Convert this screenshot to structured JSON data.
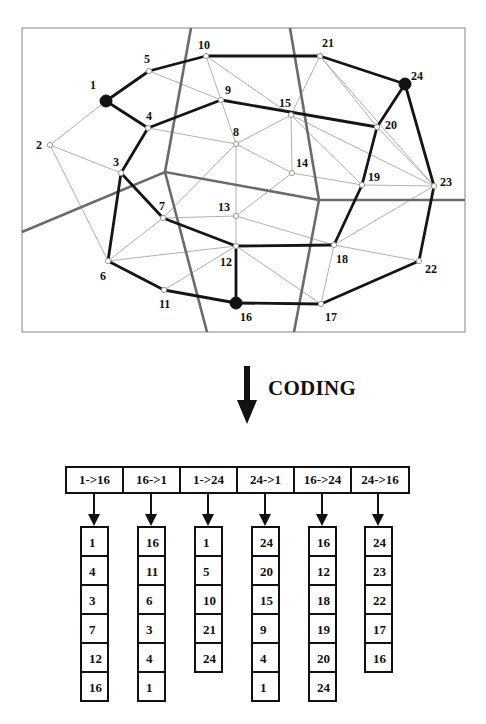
{
  "graph": {
    "nodes": [
      {
        "id": "1",
        "x": 106,
        "y": 101,
        "filled": true,
        "lx": -16,
        "ly": -12
      },
      {
        "id": "2",
        "x": 50,
        "y": 145,
        "filled": false,
        "lx": -14,
        "ly": 4
      },
      {
        "id": "3",
        "x": 121,
        "y": 173,
        "filled": false,
        "lx": -8,
        "ly": -7
      },
      {
        "id": "4",
        "x": 148,
        "y": 128,
        "filled": false,
        "lx": -2,
        "ly": -8
      },
      {
        "id": "5",
        "x": 149,
        "y": 71,
        "filled": false,
        "lx": -5,
        "ly": -8
      },
      {
        "id": "6",
        "x": 108,
        "y": 261,
        "filled": false,
        "lx": -8,
        "ly": 19
      },
      {
        "id": "7",
        "x": 163,
        "y": 218,
        "filled": false,
        "lx": -4,
        "ly": -8
      },
      {
        "id": "8",
        "x": 236,
        "y": 144,
        "filled": false,
        "lx": -3,
        "ly": -8
      },
      {
        "id": "9",
        "x": 221,
        "y": 100,
        "filled": false,
        "lx": 4,
        "ly": -6
      },
      {
        "id": "10",
        "x": 206,
        "y": 56,
        "filled": false,
        "lx": -8,
        "ly": -7
      },
      {
        "id": "11",
        "x": 164,
        "y": 290,
        "filled": false,
        "lx": -5,
        "ly": 18
      },
      {
        "id": "12",
        "x": 236,
        "y": 246,
        "filled": false,
        "lx": -16,
        "ly": 20
      },
      {
        "id": "13",
        "x": 236,
        "y": 216,
        "filled": false,
        "lx": -18,
        "ly": -5
      },
      {
        "id": "14",
        "x": 292,
        "y": 173,
        "filled": false,
        "lx": 4,
        "ly": -6
      },
      {
        "id": "15",
        "x": 291,
        "y": 115,
        "filled": false,
        "lx": -12,
        "ly": -8
      },
      {
        "id": "16",
        "x": 236,
        "y": 303,
        "filled": true,
        "lx": 4,
        "ly": 18
      },
      {
        "id": "17",
        "x": 321,
        "y": 304,
        "filled": false,
        "lx": 4,
        "ly": 17
      },
      {
        "id": "18",
        "x": 334,
        "y": 245,
        "filled": false,
        "lx": 2,
        "ly": 18
      },
      {
        "id": "19",
        "x": 362,
        "y": 185,
        "filled": false,
        "lx": 6,
        "ly": -4
      },
      {
        "id": "20",
        "x": 377,
        "y": 127,
        "filled": false,
        "lx": 8,
        "ly": 2
      },
      {
        "id": "21",
        "x": 320,
        "y": 56,
        "filled": false,
        "lx": 2,
        "ly": -9
      },
      {
        "id": "22",
        "x": 419,
        "y": 261,
        "filled": false,
        "lx": 6,
        "ly": 12
      },
      {
        "id": "23",
        "x": 434,
        "y": 186,
        "filled": false,
        "lx": 6,
        "ly": 0
      },
      {
        "id": "24",
        "x": 405,
        "y": 84,
        "filled": true,
        "lx": 6,
        "ly": -4
      }
    ],
    "thin_edges": [
      [
        "1",
        "2"
      ],
      [
        "2",
        "3"
      ],
      [
        "2",
        "6"
      ],
      [
        "3",
        "6"
      ],
      [
        "3",
        "7"
      ],
      [
        "4",
        "8"
      ],
      [
        "5",
        "9"
      ],
      [
        "10",
        "9"
      ],
      [
        "10",
        "15"
      ],
      [
        "9",
        "8"
      ],
      [
        "8",
        "15"
      ],
      [
        "8",
        "13"
      ],
      [
        "8",
        "14"
      ],
      [
        "8",
        "7"
      ],
      [
        "15",
        "14"
      ],
      [
        "15",
        "21"
      ],
      [
        "15",
        "19"
      ],
      [
        "15",
        "23"
      ],
      [
        "21",
        "20"
      ],
      [
        "21",
        "23"
      ],
      [
        "14",
        "13"
      ],
      [
        "14",
        "19"
      ],
      [
        "19",
        "23"
      ],
      [
        "19",
        "20"
      ],
      [
        "13",
        "7"
      ],
      [
        "13",
        "12"
      ],
      [
        "13",
        "18"
      ],
      [
        "7",
        "6"
      ],
      [
        "6",
        "12"
      ],
      [
        "11",
        "12"
      ],
      [
        "12",
        "17"
      ],
      [
        "18",
        "17"
      ],
      [
        "18",
        "23"
      ],
      [
        "18",
        "22"
      ],
      [
        "20",
        "23"
      ]
    ],
    "thick_edges": [
      [
        "1",
        "5"
      ],
      [
        "5",
        "10"
      ],
      [
        "10",
        "21"
      ],
      [
        "21",
        "24"
      ],
      [
        "1",
        "4"
      ],
      [
        "4",
        "9"
      ],
      [
        "9",
        "20"
      ],
      [
        "20",
        "24"
      ],
      [
        "4",
        "3"
      ],
      [
        "3",
        "7"
      ],
      [
        "7",
        "12"
      ],
      [
        "12",
        "16"
      ],
      [
        "3",
        "6"
      ],
      [
        "6",
        "11"
      ],
      [
        "11",
        "16"
      ],
      [
        "16",
        "17"
      ],
      [
        "17",
        "22"
      ],
      [
        "22",
        "23"
      ],
      [
        "23",
        "24"
      ],
      [
        "12",
        "18"
      ],
      [
        "18",
        "19"
      ],
      [
        "19",
        "20"
      ]
    ],
    "boundaries": [
      [
        [
          191,
          28
        ],
        [
          165,
          172
        ],
        [
          207,
          332
        ]
      ],
      [
        [
          290,
          28
        ],
        [
          319,
          200
        ],
        [
          294,
          332
        ]
      ],
      [
        [
          22,
          232
        ],
        [
          165,
          172
        ],
        [
          319,
          200
        ],
        [
          465,
          200
        ]
      ]
    ],
    "frame": {
      "x": 22,
      "y": 28,
      "w": 443,
      "h": 304
    }
  },
  "coding": {
    "label": "CODING",
    "icon": "down-arrow-icon"
  },
  "paths": [
    {
      "header": "1->16",
      "nodes": [
        "1",
        "4",
        "3",
        "7",
        "12",
        "16"
      ]
    },
    {
      "header": "16->1",
      "nodes": [
        "16",
        "11",
        "6",
        "3",
        "4",
        "1"
      ]
    },
    {
      "header": "1->24",
      "nodes": [
        "1",
        "5",
        "10",
        "21",
        "24"
      ]
    },
    {
      "header": "24->1",
      "nodes": [
        "24",
        "20",
        "15",
        "9",
        "4",
        "1"
      ]
    },
    {
      "header": "16->24",
      "nodes": [
        "16",
        "12",
        "18",
        "19",
        "20",
        "24"
      ]
    },
    {
      "header": "24->16",
      "nodes": [
        "24",
        "23",
        "22",
        "17",
        "16"
      ]
    }
  ],
  "colors": {
    "thick": "#151515",
    "thin": "#a8a8a8",
    "boundary": "#6b6b6b",
    "frame": "#9a9a9a"
  }
}
